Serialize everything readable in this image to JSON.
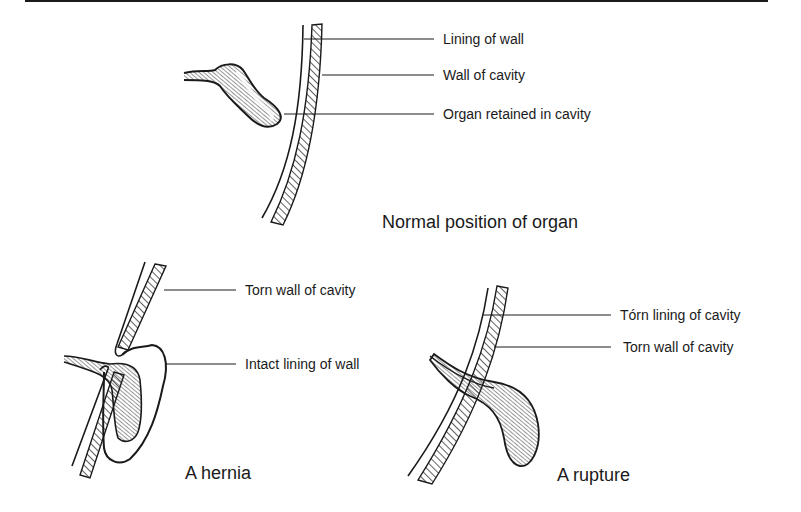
{
  "panels": {
    "normal": {
      "caption": "Normal position of organ",
      "labels": [
        "Lining of wall",
        "Wall of cavity",
        "Organ retained in cavity"
      ]
    },
    "hernia": {
      "caption": "A hernia",
      "labels": [
        "Torn wall of cavity",
        "Intact lining of wall"
      ]
    },
    "rupture": {
      "caption": "A rupture",
      "labels": [
        "Tórn lining of cavity",
        "Torn wall of cavity"
      ]
    }
  },
  "colors": {
    "ink": "#1a1a1a",
    "background": "#ffffff"
  }
}
